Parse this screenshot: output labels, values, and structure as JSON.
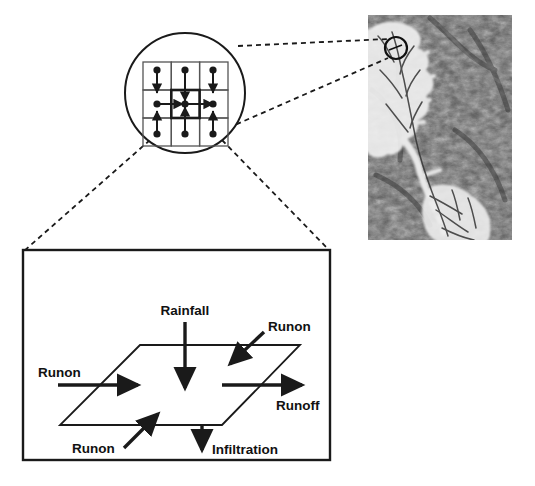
{
  "figure": {
    "background_color": "#ffffff",
    "line_color": "#1a1a1a",
    "width": 535,
    "height": 486
  },
  "satellite_panel": {
    "name": "watershed-dem-image",
    "description": "Grayscale digital elevation / satellite image of a watershed with bright dendritic drainage network on dark terrain",
    "bounds": {
      "x": 368,
      "y": 15,
      "width": 144,
      "height": 225
    },
    "terrain_dark": "#4a4a4a",
    "terrain_mid": "#7a7a7a",
    "drainage_bright": "#f2f2f2",
    "marker": {
      "name": "location-circle-marker",
      "cx": 396,
      "cy": 48,
      "r": 11,
      "color": "#111111"
    }
  },
  "magnifier": {
    "name": "grid-magnifier-circle",
    "cx": 185,
    "cy": 93,
    "r": 60,
    "grid": {
      "x": 143,
      "y": 62,
      "width": 85,
      "height": 84,
      "rows": 3,
      "cols": 3,
      "node_radius": 3.6,
      "center_cell_row": 1,
      "center_cell_col": 1,
      "flow_description": "Arrows from neighbouring cells converge on the highlighted centre cell"
    }
  },
  "connectors": {
    "to_satellite": [
      {
        "name": "dashed-connector-upper",
        "x1": 238,
        "y1": 46,
        "x2": 386,
        "y2": 39
      },
      {
        "name": "dashed-connector-lower",
        "x1": 228,
        "y1": 128,
        "x2": 386,
        "y2": 58
      }
    ],
    "to_detail_box": [
      {
        "name": "dashed-connector-left",
        "x1": 148,
        "y1": 141,
        "x2": 25,
        "y2": 250
      },
      {
        "name": "dashed-connector-right",
        "x1": 222,
        "y1": 141,
        "x2": 330,
        "y2": 250
      }
    ]
  },
  "detail_box": {
    "name": "cell-water-balance-box",
    "bounds": {
      "x": 23,
      "y": 250,
      "width": 307,
      "height": 210
    },
    "border_color": "#1a1a1a",
    "plane": {
      "name": "grid-cell-plane",
      "description": "Parallelogram representing one square grid cell in perspective",
      "points": "140,345 300,345 222,425 60,425"
    },
    "labels": {
      "rainfall": "Rainfall",
      "runon_top_right": "Runon",
      "runon_left": "Runon",
      "runon_bottom": "Runon",
      "runoff": "Runoff",
      "infiltration": "Infiltration"
    },
    "flows": [
      {
        "name": "rainfall-arrow",
        "label": "Rainfall",
        "direction": "down",
        "x1": 185,
        "y1": 320,
        "x2": 185,
        "y2": 390
      },
      {
        "name": "runon-top-right-arrow",
        "label": "Runon",
        "direction": "down-left",
        "x1": 262,
        "y1": 330,
        "x2": 228,
        "y2": 362
      },
      {
        "name": "runon-left-arrow",
        "label": "Runon",
        "direction": "right",
        "x1": 58,
        "y1": 385,
        "x2": 140,
        "y2": 385
      },
      {
        "name": "runon-bottom-arrow",
        "label": "Runon",
        "direction": "up-right",
        "x1": 125,
        "y1": 448,
        "x2": 158,
        "y2": 414
      },
      {
        "name": "runoff-arrow",
        "label": "Runoff",
        "direction": "right",
        "x1": 222,
        "y1": 385,
        "x2": 302,
        "y2": 385
      },
      {
        "name": "infiltration-arrow",
        "label": "Infiltration",
        "direction": "down",
        "x1": 202,
        "y1": 425,
        "x2": 202,
        "y2": 452
      }
    ],
    "label_positions": {
      "rainfall": {
        "x": 185,
        "y": 314,
        "anchor": "middle"
      },
      "runon_top_right": {
        "x": 268,
        "y": 330,
        "anchor": "start"
      },
      "runon_left": {
        "x": 38,
        "y": 377,
        "anchor": "start"
      },
      "runon_bottom": {
        "x": 72,
        "y": 452,
        "anchor": "start"
      },
      "runoff": {
        "x": 277,
        "y": 409,
        "anchor": "start"
      },
      "infiltration": {
        "x": 211,
        "y": 453,
        "anchor": "start"
      }
    }
  }
}
